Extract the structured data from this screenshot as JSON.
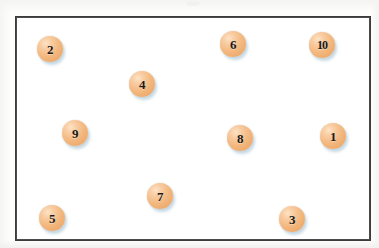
{
  "figure": {
    "type": "scatter-diagram",
    "frame": {
      "border_color": "#3c3c3c",
      "fill_color": "#ffffff",
      "x": 15,
      "y": 16,
      "width": 352,
      "height": 221
    },
    "background_color": "#fdfdfc",
    "ball_style": {
      "fill_color": "#f3b87f",
      "highlight_color": "#fde3c6",
      "shadow_color": "#96b9cd",
      "label_color": "#1a1a1a",
      "diameter": 26
    }
  },
  "chart_data": {
    "type": "scatter",
    "title": "",
    "xlabel": "",
    "ylabel": "",
    "grid": false,
    "legend": null,
    "xlim": [
      15,
      367
    ],
    "ylim": [
      16,
      237
    ],
    "points": [
      {
        "label": "2",
        "cx": 48,
        "cy": 47
      },
      {
        "label": "6",
        "cx": 231,
        "cy": 42
      },
      {
        "label": "10",
        "cx": 320,
        "cy": 43
      },
      {
        "label": "4",
        "cx": 140,
        "cy": 82
      },
      {
        "label": "9",
        "cx": 73,
        "cy": 131
      },
      {
        "label": "8",
        "cx": 238,
        "cy": 136
      },
      {
        "label": "1",
        "cx": 331,
        "cy": 134
      },
      {
        "label": "7",
        "cx": 158,
        "cy": 194
      },
      {
        "label": "5",
        "cx": 50,
        "cy": 216
      },
      {
        "label": "3",
        "cx": 290,
        "cy": 217
      }
    ]
  }
}
